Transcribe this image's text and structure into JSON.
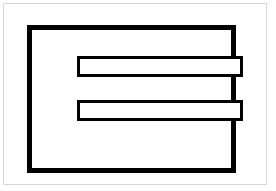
{
  "diagram": {
    "type": "line-drawing",
    "background_color": "#ffffff",
    "stroke_color": "#000000",
    "frame_border_color": "#d8d8d8",
    "shapes": [
      {
        "name": "outer-frame",
        "shape": "rectangle",
        "x": 3,
        "y": 3,
        "w": 264,
        "h": 182,
        "stroke": 1
      },
      {
        "name": "large-rectangle",
        "shape": "rectangle",
        "x": 27,
        "y": 25,
        "w": 209,
        "h": 148,
        "stroke": 5
      },
      {
        "name": "upper-bar",
        "shape": "rectangle",
        "x": 77,
        "y": 56,
        "w": 166,
        "h": 21,
        "stroke": 3
      },
      {
        "name": "lower-bar",
        "shape": "rectangle",
        "x": 77,
        "y": 100,
        "w": 166,
        "h": 21,
        "stroke": 3
      }
    ]
  }
}
